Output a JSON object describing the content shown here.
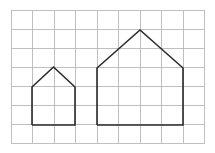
{
  "canvas": {
    "width": 215,
    "height": 153,
    "background_color": "#ffffff"
  },
  "grid": {
    "name": "square-grid",
    "origin_x": 11,
    "origin_y": 10,
    "cell_width": 21.55,
    "cell_height": 19.0,
    "columns": 9,
    "rows": 7,
    "line_color": "#b8b8b8",
    "line_width": 0.9
  },
  "figures": {
    "stroke_color": "#2b2b2b",
    "stroke_width": 1.6,
    "items": [
      {
        "label": "small-house-pentagon",
        "description": "Small pentagon house outline: 2 grid cells wide, 2 cells tall walls, roof apex 1 cell above eaves",
        "points": "32,125 32,87 53.5,67 75,87 75,125 32,125",
        "vertices": [
          {
            "name": "bottom-left",
            "x": 32,
            "y": 125
          },
          {
            "name": "eave-left",
            "x": 32,
            "y": 87
          },
          {
            "name": "apex",
            "x": 53.5,
            "y": 67
          },
          {
            "name": "eave-right",
            "x": 75,
            "y": 87
          },
          {
            "name": "bottom-right",
            "x": 75,
            "y": 125
          }
        ],
        "grid_units": {
          "width_cells": 2,
          "wall_height_cells": 2,
          "roof_height_cells": 1,
          "total_height_cells": 3
        }
      },
      {
        "label": "large-house-pentagon",
        "description": "Large pentagon house outline: 4 grid cells wide, 3 cells tall walls, roof apex 2 cells above eaves",
        "points": "97,125 97,68 140,30 183,68 183,125 97,125",
        "vertices": [
          {
            "name": "bottom-left",
            "x": 97,
            "y": 125
          },
          {
            "name": "eave-left",
            "x": 97,
            "y": 68
          },
          {
            "name": "apex",
            "x": 140,
            "y": 30
          },
          {
            "name": "eave-right",
            "x": 183,
            "y": 68
          },
          {
            "name": "bottom-right",
            "x": 183,
            "y": 125
          }
        ],
        "grid_units": {
          "width_cells": 4,
          "wall_height_cells": 3,
          "roof_height_cells": 2,
          "total_height_cells": 5
        }
      }
    ]
  }
}
